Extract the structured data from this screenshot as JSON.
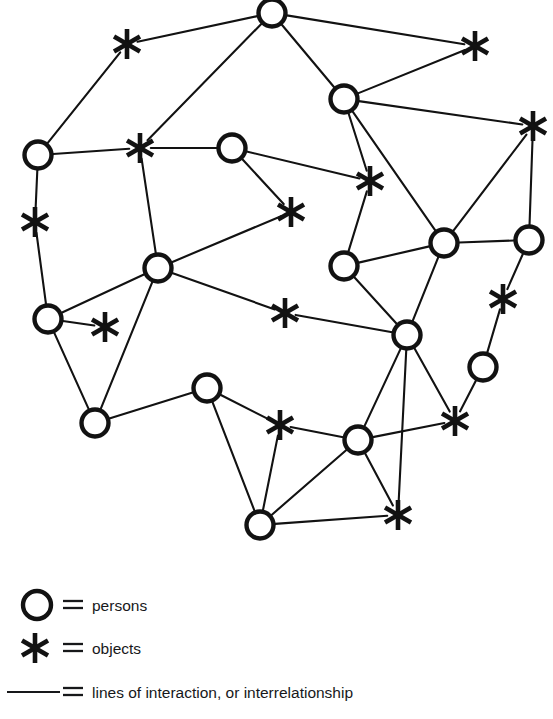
{
  "figure": {
    "kind": "sociogram-network-diagram",
    "background_color": "#ffffff",
    "ink_color": "#121212",
    "width": 553,
    "height": 719
  },
  "legend": {
    "items": [
      {
        "symbol": "circle-icon",
        "equals": "=",
        "label": "persons",
        "symbol_x": 37,
        "symbol_y": 605,
        "text_x": 92,
        "text_y": 611
      },
      {
        "symbol": "asterisk-icon",
        "equals": "=",
        "label": "objects",
        "symbol_x": 35,
        "symbol_y": 648,
        "text_x": 92,
        "text_y": 654
      },
      {
        "symbol": "line-icon",
        "equals": "=",
        "label": "lines of interaction, or interrelationship",
        "symbol_x": 37,
        "symbol_y": 692,
        "text_x": 92,
        "text_y": 698
      }
    ]
  },
  "network": {
    "person_radius": 13.5,
    "object_radius": 15,
    "persons": [
      {
        "id": "p1",
        "x": 272,
        "y": 13
      },
      {
        "id": "p2",
        "x": 344,
        "y": 99
      },
      {
        "id": "p3",
        "x": 38,
        "y": 155
      },
      {
        "id": "p4",
        "x": 232,
        "y": 148
      },
      {
        "id": "p5",
        "x": 158,
        "y": 268
      },
      {
        "id": "p6",
        "x": 344,
        "y": 266
      },
      {
        "id": "p7",
        "x": 444,
        "y": 243
      },
      {
        "id": "p8",
        "x": 529,
        "y": 240
      },
      {
        "id": "p9",
        "x": 48,
        "y": 319
      },
      {
        "id": "p10",
        "x": 407,
        "y": 335
      },
      {
        "id": "p11",
        "x": 483,
        "y": 367
      },
      {
        "id": "p12",
        "x": 95,
        "y": 423
      },
      {
        "id": "p13",
        "x": 207,
        "y": 388
      },
      {
        "id": "p14",
        "x": 358,
        "y": 440
      },
      {
        "id": "p15",
        "x": 260,
        "y": 525
      }
    ],
    "objects": [
      {
        "id": "o1",
        "x": 127,
        "y": 44
      },
      {
        "id": "o2",
        "x": 475,
        "y": 46
      },
      {
        "id": "o3",
        "x": 533,
        "y": 126
      },
      {
        "id": "o4",
        "x": 140,
        "y": 148
      },
      {
        "id": "o5",
        "x": 370,
        "y": 181
      },
      {
        "id": "o6",
        "x": 35,
        "y": 222
      },
      {
        "id": "o7",
        "x": 291,
        "y": 212
      },
      {
        "id": "o8",
        "x": 285,
        "y": 313
      },
      {
        "id": "o9",
        "x": 105,
        "y": 327
      },
      {
        "id": "o10",
        "x": 503,
        "y": 299
      },
      {
        "id": "o11",
        "x": 280,
        "y": 425
      },
      {
        "id": "o12",
        "x": 455,
        "y": 421
      },
      {
        "id": "o13",
        "x": 398,
        "y": 515
      }
    ],
    "edges": [
      [
        "o1",
        "p1"
      ],
      [
        "p1",
        "p2"
      ],
      [
        "p1",
        "o4"
      ],
      [
        "o1",
        "p3"
      ],
      [
        "p2",
        "o2"
      ],
      [
        "p2",
        "o3"
      ],
      [
        "p2",
        "o5"
      ],
      [
        "p2",
        "p7"
      ],
      [
        "o2",
        "p1"
      ],
      [
        "p3",
        "o4"
      ],
      [
        "p3",
        "o6"
      ],
      [
        "o4",
        "p4"
      ],
      [
        "o4",
        "p5"
      ],
      [
        "p4",
        "o7"
      ],
      [
        "p4",
        "o5"
      ],
      [
        "o3",
        "p7"
      ],
      [
        "o3",
        "p8"
      ],
      [
        "o6",
        "p9"
      ],
      [
        "o5",
        "p6"
      ],
      [
        "p5",
        "o7"
      ],
      [
        "p5",
        "p9"
      ],
      [
        "p5",
        "o8"
      ],
      [
        "p5",
        "p12"
      ],
      [
        "p9",
        "o9"
      ],
      [
        "p9",
        "p12"
      ],
      [
        "p6",
        "p7"
      ],
      [
        "p6",
        "p10"
      ],
      [
        "p7",
        "p8"
      ],
      [
        "p7",
        "p10"
      ],
      [
        "p8",
        "o10"
      ],
      [
        "o8",
        "p10"
      ],
      [
        "p10",
        "o12"
      ],
      [
        "p10",
        "p14"
      ],
      [
        "p10",
        "o13"
      ],
      [
        "p11",
        "o10"
      ],
      [
        "p11",
        "o12"
      ],
      [
        "p12",
        "p13"
      ],
      [
        "p13",
        "o11"
      ],
      [
        "p13",
        "p15"
      ],
      [
        "o11",
        "p15"
      ],
      [
        "o11",
        "p14"
      ],
      [
        "p14",
        "o12"
      ],
      [
        "p14",
        "p15"
      ],
      [
        "p14",
        "o13"
      ],
      [
        "p15",
        "o13"
      ]
    ]
  }
}
